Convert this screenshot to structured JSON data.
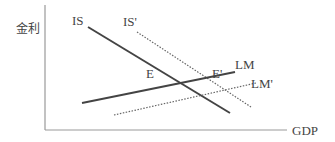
{
  "diagram": {
    "type": "IS-LM",
    "y_axis_label": "金利",
    "x_axis_label": "GDP",
    "curves": [
      {
        "name": "IS",
        "label": "IS",
        "style": "solid"
      },
      {
        "name": "IS_prime",
        "label": "IS'",
        "style": "dotted"
      },
      {
        "name": "LM",
        "label": "LM",
        "style": "solid"
      },
      {
        "name": "LM_prime",
        "label": "LM'",
        "style": "dotted"
      }
    ],
    "points": [
      {
        "name": "E",
        "label": "E"
      },
      {
        "name": "E_prime",
        "label": "E'"
      }
    ],
    "colors": {
      "axis": "#999999",
      "solid_line": "#444444",
      "dotted_line": "#666666",
      "text": "#444444"
    }
  }
}
